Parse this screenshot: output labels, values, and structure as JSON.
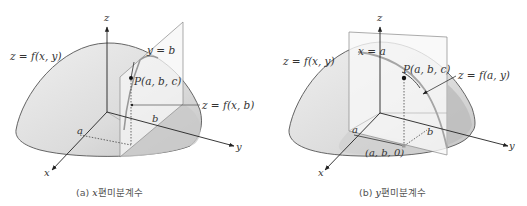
{
  "panels": [
    {
      "id": "a",
      "caption": "(a) x편미분계수",
      "caption_prefix": "(a)",
      "caption_var": "x",
      "caption_text": "편미분계수",
      "labels": {
        "z_axis": "z",
        "x_axis": "x",
        "y_axis": "y",
        "surface": "z = f(x, y)",
        "plane": "y = b",
        "point": "P(a, b, c)",
        "curve": "z = f(x, b)",
        "a_tick": "a",
        "b_tick": "b"
      }
    },
    {
      "id": "b",
      "caption": "(b) y편미분계수",
      "caption_prefix": "(b)",
      "caption_var": "y",
      "caption_text": "편미분계수",
      "labels": {
        "z_axis": "z",
        "x_axis": "x",
        "y_axis": "y",
        "surface": "z = f(x, y)",
        "plane": "x = a",
        "point": "P(a, b, c)",
        "curve": "z = f(a, y)",
        "a_tick": "a",
        "b_tick": "b",
        "base_point": "(a, b, 0)"
      }
    }
  ],
  "colors": {
    "surface_fill": "#e4e4e4",
    "surface_shade": "#c8c8c8",
    "plane_fill": "#f4f4f4",
    "stroke": "#555555",
    "axis": "#333333",
    "curve": "#a0a0a0"
  }
}
